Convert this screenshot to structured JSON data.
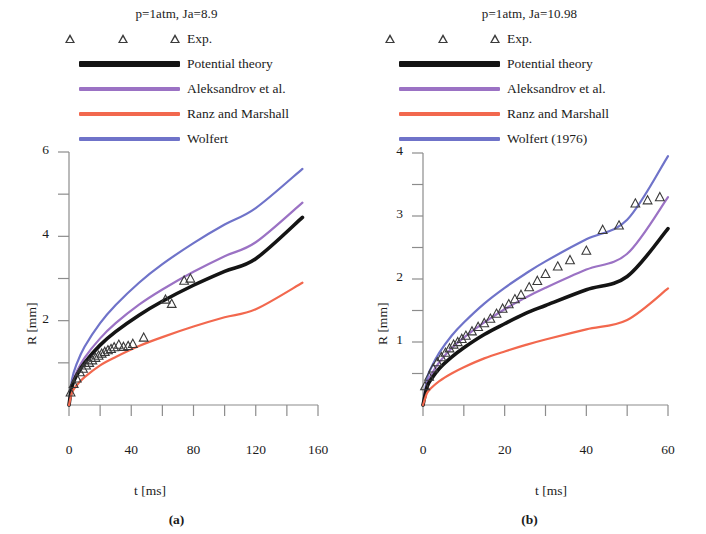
{
  "figure": {
    "panels": [
      {
        "key": "a",
        "subcaption": "(a)",
        "title": "p=1atm, Ja=8.9",
        "legend": [
          {
            "label": "Exp.",
            "type": "marker",
            "marker": "triangle-up-open",
            "color": "#3a3a3a"
          },
          {
            "label": "Potential theory",
            "type": "line",
            "color": "#141414"
          },
          {
            "label": "Aleksandrov et al.",
            "type": "line",
            "color": "#9b72c4"
          },
          {
            "label": "Ranz and Marshall",
            "type": "line",
            "color": "#f2684e"
          },
          {
            "label": "Wolfert",
            "type": "line",
            "color": "#6f73c9"
          }
        ],
        "chart_data": {
          "type": "line",
          "title": "p=1atm, Ja=8.9",
          "xlabel": "t [ms]",
          "ylabel": "R [mm]",
          "xlim": [
            0,
            160
          ],
          "ylim": [
            0,
            6
          ],
          "xticks": [
            0,
            20,
            40,
            60,
            80,
            100,
            120,
            140,
            160
          ],
          "xticklabels": [
            "0",
            "",
            "40",
            "",
            "80",
            "",
            "120",
            "",
            "160"
          ],
          "yticks": [
            0,
            1,
            2,
            3,
            4,
            5,
            6
          ],
          "yticklabels": [
            "",
            "",
            "2",
            "",
            "4",
            "",
            "6"
          ],
          "grid": false,
          "legend_position": "above-plot",
          "series": [
            {
              "name": "Wolfert",
              "color": "#6f73c9",
              "x": [
                0,
                2,
                5,
                10,
                20,
                30,
                45,
                60,
                80,
                100,
                120,
                150
              ],
              "y": [
                0,
                0.62,
                0.98,
                1.38,
                1.94,
                2.37,
                2.9,
                3.34,
                3.84,
                4.28,
                4.67,
                5.6
              ]
            },
            {
              "name": "Aleksandrov et al.",
              "color": "#9b72c4",
              "x": [
                0,
                2,
                5,
                10,
                20,
                30,
                45,
                60,
                80,
                100,
                120,
                150
              ],
              "y": [
                0,
                0.5,
                0.79,
                1.12,
                1.58,
                1.94,
                2.38,
                2.74,
                3.16,
                3.53,
                3.86,
                4.8
              ]
            },
            {
              "name": "Potential theory",
              "color": "#141414",
              "x": [
                0,
                2,
                5,
                10,
                20,
                30,
                45,
                60,
                80,
                100,
                120,
                150
              ],
              "y": [
                0,
                0.45,
                0.71,
                1.0,
                1.42,
                1.74,
                2.13,
                2.46,
                2.84,
                3.17,
                3.47,
                4.45
              ]
            },
            {
              "name": "Ranz and Marshall",
              "color": "#f2684e",
              "x": [
                0,
                2,
                5,
                10,
                20,
                30,
                45,
                60,
                80,
                100,
                120,
                150
              ],
              "y": [
                0,
                0.3,
                0.47,
                0.66,
                0.94,
                1.14,
                1.4,
                1.61,
                1.86,
                2.08,
                2.27,
                2.9
              ]
            }
          ],
          "scatter": [
            {
              "name": "Exp.",
              "marker": "triangle-up-open",
              "color": "#3a3a3a",
              "x": [
                1,
                3,
                5,
                7,
                9,
                11,
                13,
                15,
                17,
                19,
                21,
                23,
                25,
                27,
                29,
                32,
                35,
                38,
                41,
                48,
                62,
                66,
                74,
                78
              ],
              "y": [
                0.3,
                0.5,
                0.63,
                0.78,
                0.86,
                0.94,
                1.0,
                1.06,
                1.12,
                1.17,
                1.22,
                1.26,
                1.3,
                1.33,
                1.37,
                1.43,
                1.38,
                1.4,
                1.45,
                1.6,
                2.5,
                2.4,
                2.95,
                3.0
              ]
            }
          ]
        }
      },
      {
        "key": "b",
        "subcaption": "(b)",
        "title": "p=1atm, Ja=10.98",
        "legend": [
          {
            "label": "Exp.",
            "type": "marker",
            "marker": "triangle-up-open",
            "color": "#3a3a3a"
          },
          {
            "label": "Potential theory",
            "type": "line",
            "color": "#141414"
          },
          {
            "label": "Aleksandrov et al.",
            "type": "line",
            "color": "#9b72c4"
          },
          {
            "label": "Ranz and Marshall",
            "type": "line",
            "color": "#f2684e"
          },
          {
            "label": "Wolfert (1976)",
            "type": "line",
            "color": "#6f73c9"
          }
        ],
        "chart_data": {
          "type": "line",
          "title": "p=1atm, Ja=10.98",
          "xlabel": "t [ms]",
          "ylabel": "R [mm]",
          "xlim": [
            0,
            60
          ],
          "ylim": [
            0,
            4
          ],
          "xticks": [
            0,
            10,
            20,
            30,
            40,
            50,
            60
          ],
          "xticklabels": [
            "0",
            "",
            "20",
            "",
            "40",
            "",
            "60"
          ],
          "yticks": [
            0,
            0.5,
            1,
            1.5,
            2,
            2.5,
            3,
            3.5,
            4
          ],
          "yticklabels": [
            "",
            "",
            "1",
            "",
            "2",
            "",
            "3",
            "",
            "4"
          ],
          "grid": false,
          "legend_position": "above-plot",
          "series": [
            {
              "name": "Wolfert (1976)",
              "color": "#6f73c9",
              "x": [
                0,
                1,
                2,
                4,
                7,
                10,
                15,
                20,
                25,
                30,
                40,
                50,
                60
              ],
              "y": [
                0,
                0.42,
                0.59,
                0.83,
                1.1,
                1.31,
                1.61,
                1.86,
                2.08,
                2.28,
                2.63,
                2.94,
                3.95
              ]
            },
            {
              "name": "Aleksandrov et al.",
              "color": "#9b72c4",
              "x": [
                0,
                1,
                2,
                4,
                7,
                10,
                15,
                20,
                25,
                30,
                40,
                50,
                60
              ],
              "y": [
                0,
                0.34,
                0.48,
                0.68,
                0.9,
                1.07,
                1.31,
                1.52,
                1.7,
                1.86,
                2.15,
                2.4,
                3.3
              ]
            },
            {
              "name": "Potential theory",
              "color": "#141414",
              "x": [
                0,
                1,
                2,
                4,
                7,
                10,
                15,
                20,
                25,
                30,
                40,
                50,
                60
              ],
              "y": [
                0,
                0.29,
                0.41,
                0.58,
                0.76,
                0.91,
                1.12,
                1.29,
                1.45,
                1.58,
                1.83,
                2.04,
                2.8
              ]
            },
            {
              "name": "Ranz and Marshall",
              "color": "#f2684e",
              "x": [
                0,
                1,
                2,
                4,
                7,
                10,
                15,
                20,
                25,
                30,
                40,
                50,
                60
              ],
              "y": [
                0,
                0.19,
                0.27,
                0.38,
                0.5,
                0.6,
                0.74,
                0.85,
                0.95,
                1.04,
                1.2,
                1.35,
                1.85
              ]
            }
          ],
          "scatter": [
            {
              "name": "Exp.",
              "marker": "triangle-up-open",
              "color": "#3a3a3a",
              "x": [
                0.5,
                1.5,
                2.5,
                3.5,
                4.5,
                5.5,
                6.5,
                7.5,
                8.5,
                9.5,
                10.5,
                12,
                13.5,
                15,
                16.5,
                18,
                19.5,
                21,
                22.5,
                24,
                26,
                28,
                30,
                33,
                36,
                40,
                44,
                48,
                52,
                55,
                58
              ],
              "y": [
                0.3,
                0.45,
                0.58,
                0.68,
                0.76,
                0.83,
                0.9,
                0.96,
                1.0,
                1.05,
                1.1,
                1.17,
                1.24,
                1.3,
                1.37,
                1.45,
                1.53,
                1.6,
                1.68,
                1.75,
                1.87,
                1.97,
                2.08,
                2.2,
                2.3,
                2.45,
                2.78,
                2.85,
                3.2,
                3.25,
                3.3
              ]
            }
          ]
        }
      }
    ]
  }
}
